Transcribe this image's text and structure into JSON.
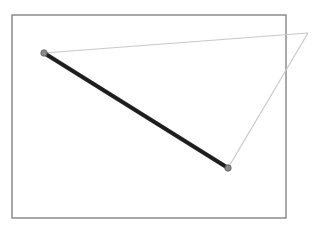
{
  "canvas": {
    "width": 313,
    "height": 229,
    "background": "#ffffff"
  },
  "frame": {
    "x": 12,
    "y": 15,
    "width": 274,
    "height": 203,
    "stroke": "#7a7a7a",
    "stroke_width": 1.3
  },
  "points": [
    {
      "id": "A",
      "x": 44,
      "y": 53
    },
    {
      "id": "B",
      "x": 228,
      "y": 168
    },
    {
      "id": "C",
      "x": 308,
      "y": 33
    }
  ],
  "segments": [
    {
      "id": "AB",
      "from": "A",
      "to": "B",
      "stroke": "#1e1e1e",
      "stroke_width": 4
    },
    {
      "id": "AC",
      "from": "A",
      "to": "C",
      "stroke": "#c8c8c8",
      "stroke_width": 1.2
    },
    {
      "id": "CB",
      "from": "C",
      "to": "B",
      "stroke": "#c8c8c8",
      "stroke_width": 1.2
    }
  ],
  "markers": {
    "radius": 3.2,
    "fill": "#8a8a8a",
    "stroke": "#555555"
  }
}
